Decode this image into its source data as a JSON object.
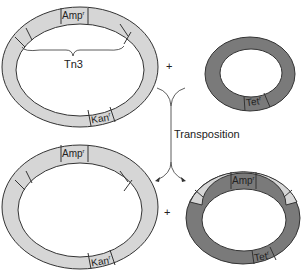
{
  "colors": {
    "light_ring": "#d6d6d6",
    "dark_ring": "#7a7a7a",
    "stroke": "#333333",
    "background": "#ffffff"
  },
  "top_left_plasmid": {
    "genes": [
      "Amp",
      "Kan"
    ],
    "gene_labels": {
      "amp": "Amp",
      "kan": "Kan",
      "sup": "r"
    },
    "transposon_label": "Tn3"
  },
  "top_right_plasmid": {
    "gene_labels": {
      "tet": "Tet",
      "sup": "r"
    }
  },
  "operators": {
    "plus_top": "+",
    "plus_bottom": "+"
  },
  "arrow": {
    "label": "Transposition"
  },
  "bottom_left_plasmid": {
    "gene_labels": {
      "amp": "Amp",
      "kan": "Kan",
      "sup": "r"
    }
  },
  "bottom_right_plasmid": {
    "gene_labels": {
      "amp": "Amp",
      "tet": "Tet",
      "sup": "r"
    }
  }
}
